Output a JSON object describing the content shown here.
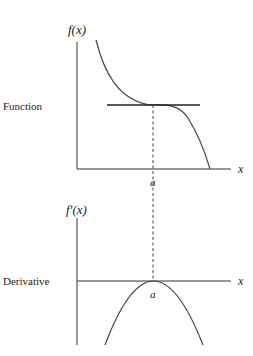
{
  "top_panel": {
    "row_label": "Function",
    "y_axis_label": "f(x)",
    "x_axis_label": "x",
    "point_label": "a"
  },
  "bottom_panel": {
    "row_label": "Derivative",
    "y_axis_label": "f′(x)",
    "x_axis_label": "x",
    "point_label": "a"
  },
  "colors": {
    "stroke": "#333333",
    "background": "#ffffff"
  }
}
